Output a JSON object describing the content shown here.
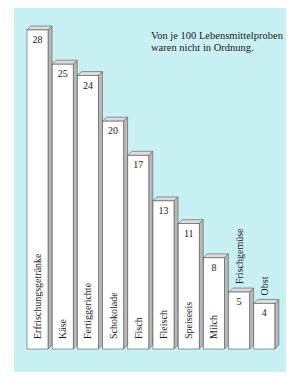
{
  "chart_data": {
    "type": "bar",
    "title": "Von je 100 Lebensmittelproben waren nicht in Ordnung.",
    "title_lines": [
      "Von je 100 Lebensmittelproben",
      "waren nicht in Ordnung."
    ],
    "xlabel": "",
    "ylabel": "",
    "ylim": [
      0,
      28
    ],
    "grid": false,
    "legend": "none",
    "categories": [
      "Erfrischungsgetränke",
      "Käse",
      "Fertiggerichte",
      "Schokolade",
      "Fisch",
      "Fleisch",
      "Speiseeis",
      "Milch",
      "Frischgemüse",
      "Obst"
    ],
    "values": [
      28,
      25,
      24,
      20,
      17,
      13,
      11,
      8,
      5,
      4
    ],
    "label_outside": [
      false,
      false,
      false,
      false,
      false,
      false,
      false,
      false,
      true,
      true
    ]
  },
  "colors": {
    "background": "#c9f0f3",
    "bar_front": "#ffffff",
    "bar_side": "#b8b8b8",
    "bar_top": "#dcdcdc",
    "bar_outline": "#555555",
    "text": "#1a1a1a"
  }
}
